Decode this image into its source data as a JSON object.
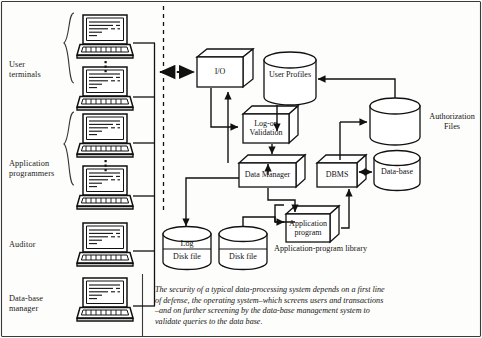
{
  "figure": {
    "title": "Security of a typical data-processing system",
    "caption": "The security of a typical data-processing system depends on a first line of defense, the operating system–which screens users and transactions –and on further screening by the data-base management system to validate queries to the data base.",
    "caption_lines": [
      "The security of a typical data-processing system depends on a first line",
      "of defense, the operating system–which screens users and transactions",
      "–and on further screening by the data-base management system to",
      "validate queries to the data base."
    ],
    "background_color": "#fdfdfb",
    "ink_color": "#111111"
  },
  "actor_groups": [
    {
      "id": "user-terminals",
      "label": "User\nterminals",
      "label_lines": [
        "User",
        "terminals"
      ],
      "terminal_count": 2,
      "has_brace": true,
      "has_ellipsis": true
    },
    {
      "id": "application-programmers",
      "label": "Application\nprogrammers",
      "label_lines": [
        "Application",
        "programmers"
      ],
      "terminal_count": 2,
      "has_brace": true,
      "has_ellipsis": true
    },
    {
      "id": "auditor",
      "label": "Auditor",
      "label_lines": [
        "Auditor"
      ],
      "terminal_count": 1,
      "has_brace": false,
      "has_ellipsis": false
    },
    {
      "id": "database-manager",
      "label": "Data-base\nmanager",
      "label_lines": [
        "Data-base",
        "manager"
      ],
      "terminal_count": 1,
      "has_brace": false,
      "has_ellipsis": false
    }
  ],
  "process_boxes": [
    {
      "id": "io",
      "label": "I/O",
      "label_lines": [
        "I/O"
      ]
    },
    {
      "id": "logon-validation",
      "label": "Log-on\nValidation",
      "label_lines": [
        "Log-on",
        "Validation"
      ]
    },
    {
      "id": "data-manager",
      "label": "Data Manager",
      "label_lines": [
        "Data Manager"
      ]
    },
    {
      "id": "dbms",
      "label": "DBMS",
      "label_lines": [
        "DBMS"
      ]
    },
    {
      "id": "application-program",
      "label": "Application\nprogram",
      "label_lines": [
        "Application",
        "program"
      ]
    }
  ],
  "data_stores": [
    {
      "id": "user-profiles",
      "label": "User Profiles",
      "label_lines": [
        "User Profiles"
      ],
      "label_position": "inside"
    },
    {
      "id": "authorization-files",
      "label": "Authorization\nFiles",
      "label_lines": [
        "Authorization",
        "Files"
      ],
      "label_position": "right"
    },
    {
      "id": "database",
      "label": "Data-base",
      "label_lines": [
        "Data-base"
      ],
      "label_position": "inside"
    },
    {
      "id": "log-disk-file",
      "label": "Log\nDisk file",
      "label_lines": [
        "Log",
        "Disk file"
      ],
      "label_position": "inside"
    },
    {
      "id": "disk-file",
      "label": "Disk file",
      "label_lines": [
        "Disk file"
      ],
      "label_position": "inside"
    }
  ],
  "annotations": [
    {
      "id": "application-program-library",
      "label": "Application-program library"
    }
  ],
  "connections": [
    {
      "from": "terminal-bus",
      "to": "io",
      "style": "dashed",
      "arrow": "both"
    },
    {
      "from": "io",
      "to": "logon-validation",
      "style": "solid",
      "arrow": "end"
    },
    {
      "from": "user-profiles",
      "to": "logon-validation",
      "style": "solid",
      "arrow": "end"
    },
    {
      "from": "logon-validation",
      "to": "data-manager",
      "style": "solid",
      "arrow": "end"
    },
    {
      "from": "data-manager",
      "to": "io",
      "style": "solid",
      "arrow": "end"
    },
    {
      "from": "data-manager",
      "to": "application-program",
      "style": "solid",
      "arrow": "both"
    },
    {
      "from": "data-manager",
      "to": "log-disk-file",
      "style": "solid",
      "arrow": "end"
    },
    {
      "from": "disk-file",
      "to": "application-program",
      "style": "solid",
      "arrow": "end"
    },
    {
      "from": "application-program",
      "to": "dbms",
      "style": "solid",
      "arrow": "end"
    },
    {
      "from": "dbms",
      "to": "database",
      "style": "solid",
      "arrow": "both"
    },
    {
      "from": "dbms",
      "to": "authorization-files",
      "style": "solid",
      "arrow": "end"
    },
    {
      "from": "authorization-files",
      "to": "user-profiles",
      "style": "solid",
      "arrow": "end"
    },
    {
      "from": "data-manager",
      "to": "dbms",
      "style": "solid",
      "arrow": "end"
    }
  ]
}
